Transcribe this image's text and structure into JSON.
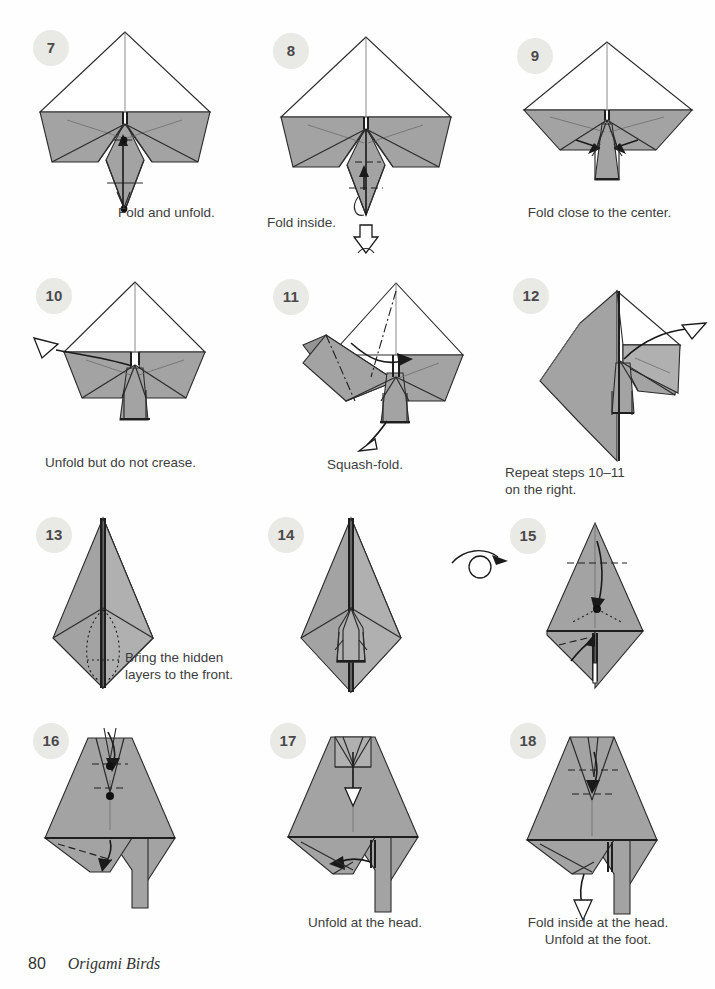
{
  "page": {
    "folio": "80",
    "book_title": "Origami Birds",
    "background_color": "#fefefe"
  },
  "palette": {
    "paper_gray": "#a3a3a3",
    "paper_white": "#ffffff",
    "badge_bg": "#e9e9e6",
    "ink": "#2b2b2b",
    "text": "#3d3d3d"
  },
  "symbols": {
    "turn_over": "turn-over-loop-arrow"
  },
  "steps": [
    {
      "number": "7",
      "caption": "Fold and unfold.",
      "caption_align": "left",
      "model": "preliminary-base-with-flaps"
    },
    {
      "number": "8",
      "caption": "Fold inside.",
      "caption_align": "left",
      "model": "preliminary-base-with-flaps"
    },
    {
      "number": "9",
      "caption": "Fold close to the center.",
      "caption_align": "center",
      "model": "preliminary-base-with-flaps"
    },
    {
      "number": "10",
      "caption": "Unfold but do not crease.",
      "caption_align": "center",
      "model": "preliminary-base-narrow-flaps"
    },
    {
      "number": "11",
      "caption": "Squash-fold.",
      "caption_align": "center",
      "model": "squash-fold-left-wing"
    },
    {
      "number": "12",
      "caption": "Repeat steps 10–11\non the right.",
      "caption_align": "left",
      "model": "squash-fold-right-wing"
    },
    {
      "number": "13",
      "caption": "Bring the hidden\nlayers to the front.",
      "caption_align": "left",
      "model": "kite-diamond-hidden-layers"
    },
    {
      "number": "14",
      "caption": "",
      "caption_align": "center",
      "model": "kite-diamond-front-layers"
    },
    {
      "number": "15",
      "caption": "",
      "caption_align": "center",
      "model": "kite-diamond-head-and-foot"
    },
    {
      "number": "16",
      "caption": "",
      "caption_align": "center",
      "model": "bird-body-head-crimp"
    },
    {
      "number": "17",
      "caption": "Unfold at the head.",
      "caption_align": "center",
      "model": "bird-body-head-unfold"
    },
    {
      "number": "18",
      "caption": "Fold inside at the head.\nUnfold at the foot.",
      "caption_align": "center",
      "model": "bird-body-head-inside-foot-unfold"
    }
  ]
}
